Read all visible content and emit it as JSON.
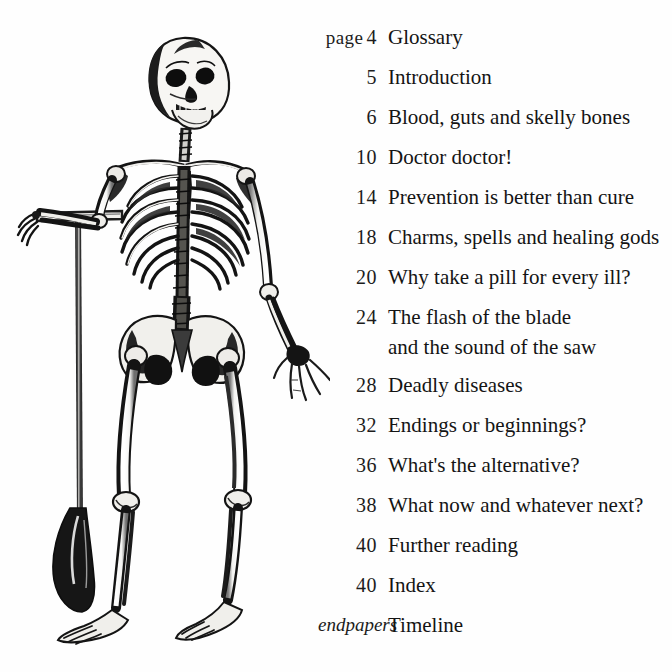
{
  "page": {
    "background_color": "#fefefe",
    "text_color": "#141414"
  },
  "illustration": {
    "name": "skeleton-with-spade",
    "description": "Anatomical engraving of a human skeleton leaning on a spade",
    "ink_color": "#111111"
  },
  "contents": {
    "page_label": "page",
    "rows": [
      {
        "number": "4",
        "prefix": "page",
        "title": "Glossary"
      },
      {
        "number": "5",
        "prefix": "",
        "title": "Introduction"
      },
      {
        "number": "6",
        "prefix": "",
        "title": "Blood, guts and skelly bones"
      },
      {
        "number": "10",
        "prefix": "",
        "title": "Doctor doctor!"
      },
      {
        "number": "14",
        "prefix": "",
        "title": "Prevention is better than cure"
      },
      {
        "number": "18",
        "prefix": "",
        "title": "Charms, spells and healing gods"
      },
      {
        "number": "20",
        "prefix": "",
        "title": "Why take a pill for every ill?"
      },
      {
        "number": "24",
        "prefix": "",
        "title": "The flash of the blade",
        "title_line2": "and the sound of the saw"
      },
      {
        "number": "28",
        "prefix": "",
        "title": "Deadly diseases"
      },
      {
        "number": "32",
        "prefix": "",
        "title": "Endings or beginnings?"
      },
      {
        "number": "36",
        "prefix": "",
        "title": "What's the alternative?"
      },
      {
        "number": "38",
        "prefix": "",
        "title": "What now and whatever next?"
      },
      {
        "number": "40",
        "prefix": "",
        "title": "Further reading"
      },
      {
        "number": "40",
        "prefix": "",
        "title": "Index"
      },
      {
        "number": "endpapers",
        "prefix": "",
        "title": "Timeline",
        "italic": true
      }
    ]
  }
}
